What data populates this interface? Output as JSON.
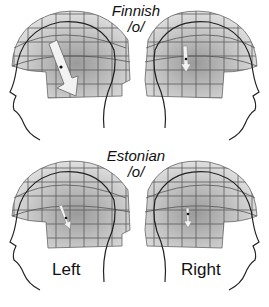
{
  "figure": {
    "panels": [
      {
        "language": "Finnish",
        "vowel": "/o/",
        "hemisphere": "left",
        "arrow": "large"
      },
      {
        "language": "Finnish",
        "vowel": "/o/",
        "hemisphere": "right",
        "arrow": "small"
      },
      {
        "language": "Estonian",
        "vowel": "/o/",
        "hemisphere": "left",
        "arrow": "small"
      },
      {
        "language": "Estonian",
        "vowel": "/o/",
        "hemisphere": "right",
        "arrow": "small"
      }
    ],
    "titles": {
      "top_language": "Finnish",
      "top_vowel": "/o/",
      "bottom_language": "Estonian",
      "bottom_vowel": "/o/"
    },
    "labels": {
      "left": "Left",
      "right": "Right"
    },
    "colors": {
      "helmet_fill": "#c9c9c9",
      "helmet_grid": "#555555",
      "outline": "#222222",
      "arrow_fill": "#f2f2f2"
    }
  }
}
